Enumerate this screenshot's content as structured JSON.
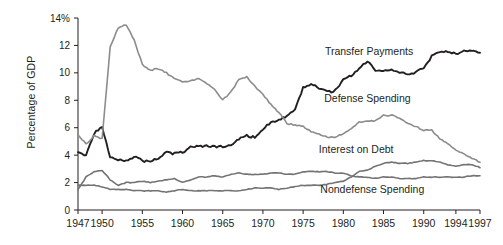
{
  "chart_data": {
    "type": "line",
    "title": "",
    "xlabel": "",
    "ylabel": "Percentage of GDP",
    "ylim": [
      0,
      14
    ],
    "xlim": [
      1947,
      1997
    ],
    "grid": false,
    "legend_position": "inline-annotations",
    "y_ticks": [
      "0",
      "2",
      "4",
      "6",
      "8",
      "10",
      "12",
      "14%"
    ],
    "y_tick_values": [
      0,
      2,
      4,
      6,
      8,
      10,
      12,
      14
    ],
    "x_ticks": [
      "1947",
      "1950",
      "1955",
      "1960",
      "1965",
      "1970",
      "1975",
      "1980",
      "1985",
      "1990",
      "1994",
      "1997"
    ],
    "x_tick_values": [
      1947,
      1950,
      1955,
      1960,
      1965,
      1970,
      1975,
      1980,
      1985,
      1990,
      1994,
      1997
    ],
    "colors": {
      "transfer_payments": "#231f20",
      "defense_spending": "#8c8c8c",
      "interest_on_debt": "#231f20",
      "nondefense_spending": "#737373",
      "axis": "#231f20"
    },
    "annotations": [
      {
        "text": "Transfer Payments",
        "x": 1983.2,
        "y": 11.3
      },
      {
        "text": "Defense Spending",
        "x": 1983.0,
        "y": 7.9
      },
      {
        "text": "Interest on Debt",
        "x": 1981.6,
        "y": 4.15
      },
      {
        "text": "Nondefense Spending",
        "x": 1983.6,
        "y": 1.25
      }
    ],
    "x": [
      1947,
      1948,
      1949,
      1950,
      1951,
      1952,
      1953,
      1954,
      1955,
      1956,
      1957,
      1958,
      1959,
      1960,
      1961,
      1962,
      1963,
      1964,
      1965,
      1966,
      1967,
      1968,
      1969,
      1970,
      1971,
      1972,
      1973,
      1974,
      1975,
      1976,
      1977,
      1978,
      1979,
      1980,
      1981,
      1982,
      1983,
      1984,
      1985,
      1986,
      1987,
      1988,
      1989,
      1990,
      1991,
      1992,
      1993,
      1994,
      1995,
      1996,
      1997
    ],
    "series": [
      {
        "name": "Transfer Payments",
        "color": "#231f20",
        "values": [
          4.2,
          4.0,
          5.6,
          6.0,
          3.9,
          3.7,
          3.6,
          3.9,
          3.6,
          3.5,
          3.8,
          4.2,
          4.1,
          4.2,
          4.6,
          4.6,
          4.7,
          4.6,
          4.6,
          4.7,
          5.2,
          5.4,
          5.3,
          5.9,
          6.4,
          6.6,
          6.8,
          7.3,
          8.9,
          9.2,
          8.9,
          8.6,
          8.7,
          9.5,
          9.8,
          10.3,
          10.9,
          10.1,
          10.2,
          10.2,
          10.0,
          9.9,
          10.0,
          10.4,
          11.2,
          11.6,
          11.5,
          11.4,
          11.6,
          11.6,
          11.4
        ]
      },
      {
        "name": "Defense Spending",
        "color": "#8c8c8c",
        "values": [
          5.5,
          4.8,
          5.4,
          5.2,
          11.9,
          13.3,
          13.5,
          12.4,
          10.6,
          10.2,
          10.3,
          10.0,
          9.6,
          9.3,
          9.4,
          9.6,
          9.2,
          8.8,
          8.0,
          8.6,
          9.5,
          9.7,
          9.0,
          8.4,
          7.7,
          7.1,
          6.3,
          6.2,
          6.1,
          5.7,
          5.5,
          5.3,
          5.3,
          5.6,
          5.9,
          6.4,
          6.5,
          6.5,
          6.9,
          6.9,
          6.7,
          6.3,
          6.1,
          5.8,
          5.8,
          5.2,
          4.8,
          4.4,
          4.1,
          3.8,
          3.5
        ]
      },
      {
        "name": "Interest on Debt",
        "color": "#737373",
        "values": [
          1.8,
          1.8,
          1.8,
          1.7,
          1.5,
          1.5,
          1.5,
          1.4,
          1.4,
          1.4,
          1.4,
          1.3,
          1.4,
          1.5,
          1.4,
          1.4,
          1.4,
          1.4,
          1.4,
          1.4,
          1.4,
          1.5,
          1.6,
          1.6,
          1.6,
          1.5,
          1.6,
          1.7,
          1.8,
          1.8,
          1.8,
          1.9,
          2.0,
          2.1,
          2.4,
          2.8,
          2.9,
          3.2,
          3.4,
          3.5,
          3.4,
          3.4,
          3.5,
          3.6,
          3.6,
          3.5,
          3.3,
          3.2,
          3.3,
          3.3,
          3.1
        ]
      },
      {
        "name": "Nondefense Spending",
        "color": "#737373",
        "values": [
          1.5,
          2.4,
          2.8,
          2.9,
          2.2,
          1.8,
          2.0,
          2.0,
          2.1,
          2.0,
          2.1,
          2.2,
          2.3,
          2.0,
          2.2,
          2.4,
          2.4,
          2.5,
          2.4,
          2.6,
          2.7,
          2.6,
          2.6,
          2.6,
          2.7,
          2.7,
          2.6,
          2.6,
          2.8,
          2.8,
          2.8,
          2.8,
          2.7,
          2.7,
          2.5,
          2.4,
          2.4,
          2.3,
          2.4,
          2.4,
          2.3,
          2.3,
          2.3,
          2.4,
          2.4,
          2.4,
          2.4,
          2.4,
          2.4,
          2.5,
          2.5
        ]
      }
    ]
  }
}
